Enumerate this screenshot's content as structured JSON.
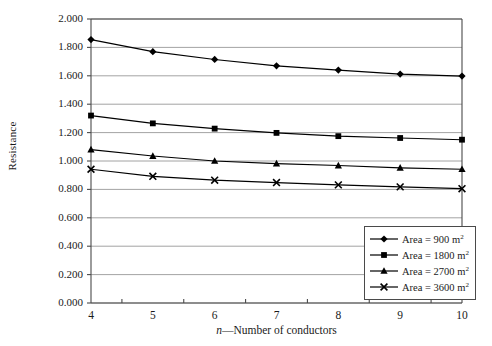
{
  "chart_data": {
    "type": "line",
    "title": "",
    "xlabel": "n—Number of conductors",
    "xlabel_italic_prefix": "n",
    "xlabel_rest": "—Number of conductors",
    "ylabel": "Resistance",
    "x": [
      4,
      5,
      6,
      7,
      8,
      9,
      10
    ],
    "xlim": [
      4,
      10
    ],
    "ylim": [
      0.0,
      2.0
    ],
    "grid": true,
    "legend_position": "bottom-right",
    "xtick_labels": [
      "4",
      "5",
      "6",
      "7",
      "8",
      "9",
      "10"
    ],
    "ytick_labels": [
      "0.000",
      "0.200",
      "0.400",
      "0.600",
      "0.800",
      "1.000",
      "1.200",
      "1.400",
      "1.600",
      "1.800",
      "2.000"
    ],
    "ytick_values": [
      0.0,
      0.2,
      0.4,
      0.6,
      0.8,
      1.0,
      1.2,
      1.4,
      1.6,
      1.8,
      2.0
    ],
    "series": [
      {
        "name": "Area = 900 m2",
        "label_main": "Area = 900 m",
        "label_sup": "2",
        "marker": "diamond",
        "color": "#000000",
        "values": [
          1.855,
          1.77,
          1.715,
          1.67,
          1.64,
          1.612,
          1.598
        ]
      },
      {
        "name": "Area = 1800 m2",
        "label_main": "Area = 1800 m",
        "label_sup": "2",
        "marker": "square",
        "color": "#000000",
        "values": [
          1.32,
          1.265,
          1.228,
          1.198,
          1.175,
          1.162,
          1.15
        ]
      },
      {
        "name": "Area = 2700 m2",
        "label_main": "Area = 2700 m",
        "label_sup": "2",
        "marker": "triangle",
        "color": "#000000",
        "values": [
          1.08,
          1.035,
          1.0,
          0.982,
          0.968,
          0.952,
          0.942
        ]
      },
      {
        "name": "Area = 3600 m2",
        "label_main": "Area = 3600 m",
        "label_sup": "2",
        "marker": "cross",
        "color": "#000000",
        "values": [
          0.942,
          0.892,
          0.865,
          0.848,
          0.832,
          0.818,
          0.805
        ]
      }
    ]
  },
  "colors": {
    "axis": "#4a4a4a",
    "grid": "#8c8c8c",
    "series": "#000000",
    "background": "#ffffff"
  }
}
